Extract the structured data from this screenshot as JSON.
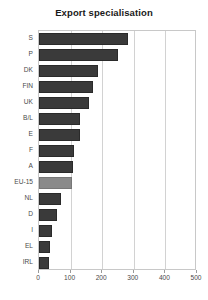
{
  "chart_data": {
    "type": "bar",
    "orientation": "horizontal",
    "title": "Export specialisation",
    "xlabel": "",
    "ylabel": "",
    "categories": [
      "S",
      "P",
      "DK",
      "FIN",
      "UK",
      "B/L",
      "E",
      "F",
      "A",
      "EU-15",
      "NL",
      "D",
      "I",
      "EL",
      "IRL"
    ],
    "values": [
      282,
      250,
      187,
      171,
      158,
      130,
      130,
      111,
      107,
      104,
      70,
      57,
      41,
      35,
      32
    ],
    "xlim": [
      0,
      500
    ],
    "xticks": [
      0,
      100,
      200,
      300,
      400,
      500
    ],
    "xtick_labels": [
      "0",
      "100",
      "200",
      "300",
      "400",
      "500"
    ],
    "grid": true,
    "grid_axis": "x",
    "legend": false,
    "highlight_category": "EU-15",
    "colors": {
      "bar": "#3a3a3a",
      "bar_highlight": "#8a8a8a",
      "grid": "#d2d2d2",
      "frame": "#c8c8c8",
      "text": "#4a4a4a",
      "title": "#1a1a1a",
      "background": "#ffffff"
    }
  }
}
